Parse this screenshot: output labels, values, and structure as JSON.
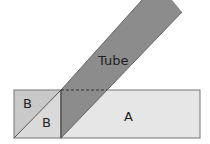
{
  "diagram": {
    "labels": {
      "tube": "Tube",
      "region_a": "A",
      "region_b_upper": "B",
      "region_b_lower": "B"
    },
    "colors": {
      "tube": "#8c8c8c",
      "region_a": "#e6e6e6",
      "region_b_upper": "#c9c9c9",
      "region_b_lower": "#dadada",
      "outline": "#555555"
    }
  }
}
